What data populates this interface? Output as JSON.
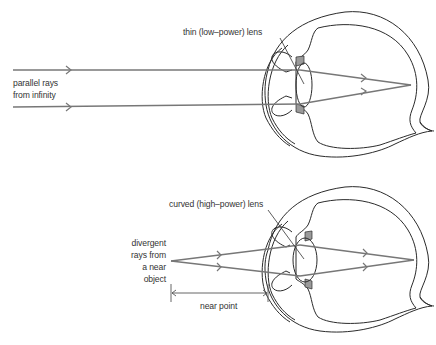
{
  "diagram": {
    "panels": [
      {
        "id": "top",
        "lens_label": "thin (low–power) lens",
        "source_label_line1": "parallel rays",
        "source_label_line2": "from infinity"
      },
      {
        "id": "bottom",
        "lens_label": "curved (high–power) lens",
        "source_label_line1": "divergent",
        "source_label_line2": "rays from",
        "source_label_line3": "a near",
        "source_label_line4": "object",
        "dimension_label": "near point"
      }
    ],
    "colors": {
      "ray": "#777777",
      "outline": "#2b2b2b",
      "eye_fill": "#ebebeb",
      "text": "#333333"
    }
  }
}
